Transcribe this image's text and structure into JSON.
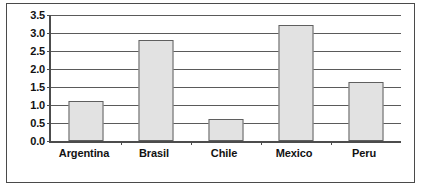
{
  "chart_data": {
    "type": "bar",
    "title": "",
    "subtitle": "",
    "xlabel": "",
    "ylabel": "",
    "categories": [
      "Argentina",
      "Brasil",
      "Chile",
      "Mexico",
      "Peru"
    ],
    "values": [
      1.12,
      2.8,
      0.6,
      3.22,
      1.65
    ],
    "ylim": [
      0.0,
      3.5
    ],
    "ytick_labels": [
      "0.0",
      "0.5",
      "1.0",
      "1.5",
      "2.0",
      "2.5",
      "3.0",
      "3.5"
    ],
    "ytick_values": [
      0.0,
      0.5,
      1.0,
      1.5,
      2.0,
      2.5,
      3.0,
      3.5
    ],
    "grid": true,
    "legend": false,
    "legend_position": "none",
    "bar_fill_color": "#e2e2e2",
    "bar_border_color": "#5f5f5f",
    "gridline_color": "#5a5a5a",
    "axis_color": "#4c4c4c",
    "frame_color": "#4a4a4a",
    "text_color": "#121212",
    "background_color": "#ffffff"
  }
}
